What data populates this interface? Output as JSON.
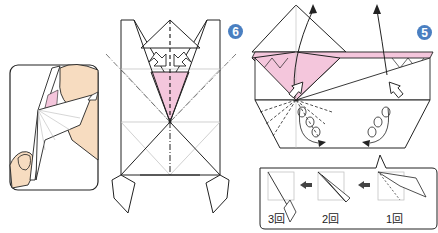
{
  "diagram": {
    "type": "origami-instructions",
    "colors": {
      "paper": "#ffffff",
      "paper_back": "#f4c6dc",
      "line": "#222222",
      "crease": "#bbbbbb",
      "skin": "#f7dcc0",
      "badge": "#4a7fc1"
    },
    "steps": [
      {
        "number": "6",
        "position": "center",
        "description": "folded model with valley/mountain fold lines and reverse folds"
      },
      {
        "number": "5",
        "position": "right",
        "description": "pleat folds at bottom corners, flaps lifted upward with arrows"
      }
    ],
    "hand_inset": {
      "description": "hand holding folded paper model"
    },
    "sub_sequence": {
      "labels": [
        "3回",
        "2回",
        "1回"
      ],
      "arrows": [
        "arrow-left",
        "arrow-left"
      ],
      "order_note": "right to left"
    }
  }
}
